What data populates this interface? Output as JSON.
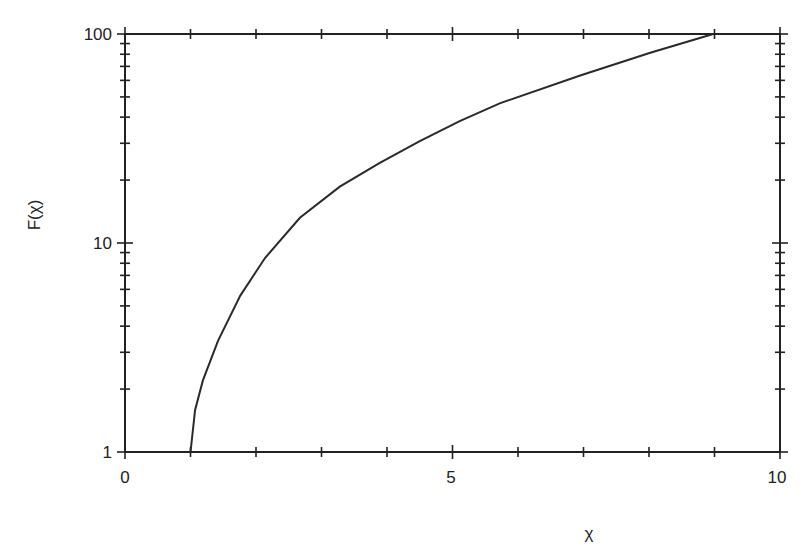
{
  "chart_data": {
    "type": "line",
    "title": "",
    "xlabel": "χ",
    "ylabel": "F(χ)",
    "xscale": "linear",
    "yscale": "log",
    "xlim": [
      0,
      10
    ],
    "ylim": [
      1,
      100
    ],
    "x_tick_labels": [
      "0",
      "5",
      "10"
    ],
    "x_ticks": [
      0,
      1,
      2,
      3,
      4,
      5,
      6,
      7,
      8,
      9,
      10
    ],
    "y_tick_labels": [
      "1",
      "10",
      "100"
    ],
    "y_ticks": [
      1,
      10,
      100
    ],
    "grid": false,
    "legend": null,
    "series": [
      {
        "name": "F(χ)",
        "x": [
          1.0,
          1.07,
          1.19,
          1.42,
          1.76,
          2.14,
          2.67,
          3.28,
          3.89,
          4.5,
          5.11,
          5.73,
          6.95,
          8.02,
          8.98
        ],
        "y": [
          1.0,
          1.59,
          2.2,
          3.4,
          5.6,
          8.5,
          13.2,
          18.6,
          24.2,
          30.7,
          38.3,
          46.7,
          63.3,
          81.3,
          100
        ]
      }
    ]
  },
  "labels": {
    "x_axis": "χ",
    "y_axis": "F(χ)",
    "x0": "0",
    "x5": "5",
    "x10": "10",
    "y1": "1",
    "y10": "10",
    "y100": "100"
  }
}
